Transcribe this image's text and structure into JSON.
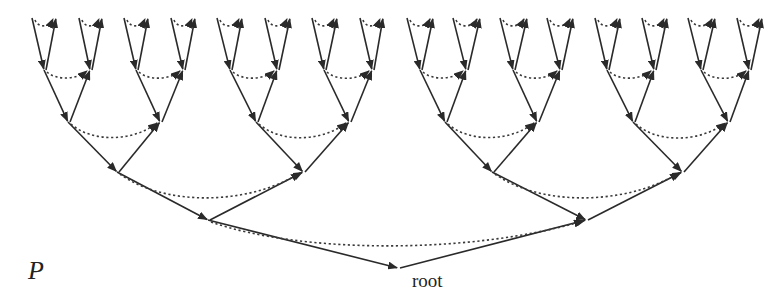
{
  "labels": {
    "p": "P",
    "root": "root"
  },
  "style": {
    "solid_color": "#2a2a2a",
    "dotted_color": "#3a3a3a",
    "background": "#ffffff"
  },
  "tree": {
    "depth": 5,
    "leaf_pairs_top_y": 18,
    "levels": [
      {
        "level": "leaf-tops",
        "y": 18,
        "x": [
          32,
          56,
          79,
          102,
          124,
          148,
          171,
          195,
          217,
          242,
          265,
          290,
          312,
          337,
          360,
          383,
          407,
          433,
          453,
          480,
          500,
          527,
          547,
          573,
          595,
          620,
          642,
          667,
          688,
          715,
          737,
          762
        ]
      },
      {
        "level": 3,
        "y": 70,
        "x": [
          44,
          90,
          136,
          183,
          230,
          277,
          324,
          372,
          420,
          466,
          513,
          560,
          607,
          654,
          701,
          749
        ]
      },
      {
        "level": 2,
        "y": 122,
        "x": [
          68,
          160,
          256,
          349,
          445,
          537,
          633,
          728
        ]
      },
      {
        "level": 1,
        "y": 172,
        "x": [
          117,
          303,
          492,
          682
        ]
      },
      {
        "level": 0,
        "y": 220,
        "x": [
          208,
          586
        ]
      },
      {
        "level": "root",
        "y": 268,
        "x": [
          398
        ]
      }
    ]
  }
}
